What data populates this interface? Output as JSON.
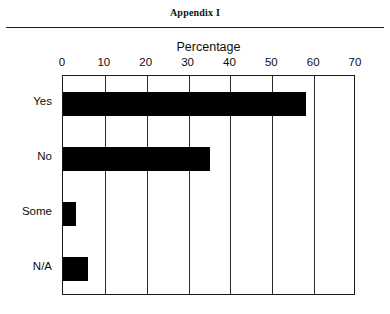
{
  "page": {
    "appendix_title": "Appendix I"
  },
  "chart_data": {
    "type": "bar",
    "orientation": "horizontal",
    "title": "Percentage",
    "xlabel": "",
    "ylabel": "",
    "categories": [
      "Yes",
      "No",
      "Some",
      "N/A"
    ],
    "values": [
      58,
      35,
      3,
      6
    ],
    "series": [
      {
        "name": "Percentage",
        "values": [
          58,
          35,
          3,
          6
        ]
      }
    ],
    "xlim": [
      0,
      70
    ],
    "xticks": [
      0,
      10,
      20,
      30,
      40,
      50,
      60,
      70
    ],
    "xtick_labels": [
      "0",
      "10",
      "20",
      "30",
      "40",
      "50",
      "60",
      "70"
    ],
    "xaxis_position": "top",
    "grid": true,
    "grid_axis": "x",
    "legend": false,
    "bar_color": "#000000",
    "plot_background": "#ffffff",
    "axis_color": "#1a1a1a"
  }
}
